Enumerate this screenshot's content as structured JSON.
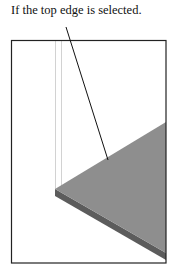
{
  "caption": "If the top edge is selected.",
  "figure": {
    "colors": {
      "frame": "#222222",
      "top_face": "#8c8c8c",
      "side_face": "#5a5a5a",
      "leader": "#111111",
      "guide_lines": "#cfcfcf"
    }
  }
}
